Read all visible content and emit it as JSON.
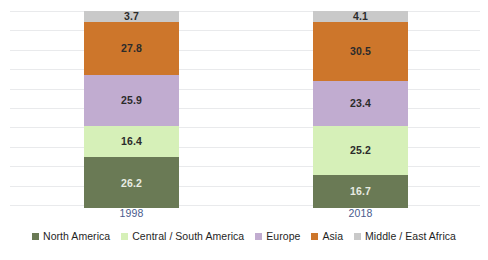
{
  "chart_data": {
    "type": "bar",
    "subtype": "stacked-100-percent",
    "title": "",
    "subtitle": "",
    "xlabel": "",
    "ylabel": "",
    "ylim": [
      0,
      100
    ],
    "grid": true,
    "legend_position": "bottom",
    "categories": [
      "1998",
      "2018"
    ],
    "series": [
      {
        "name": "North America",
        "color": "#6a7a55",
        "values": [
          26.2,
          16.7
        ]
      },
      {
        "name": "Central / South America",
        "color": "#d6f0b8",
        "values": [
          16.4,
          25.2
        ]
      },
      {
        "name": "Europe",
        "color": "#c1acd0",
        "values": [
          25.9,
          23.4
        ]
      },
      {
        "name": "Asia",
        "color": "#cd762b",
        "values": [
          27.8,
          30.5
        ]
      },
      {
        "name": "Middle / East Africa",
        "color": "#c9c9c9",
        "values": [
          3.7,
          4.1
        ]
      }
    ],
    "stack_order_bottom_to_top": [
      "North America",
      "Central / South America",
      "Europe",
      "Asia",
      "Middle / East Africa"
    ]
  },
  "axis": {
    "category_labels": [
      "1998",
      "2018"
    ],
    "category_label_color": "#4a5b8c",
    "gridline_color": "#e9eaec",
    "gridline_count": 11
  },
  "bars": {
    "bar_1998": {
      "category": "1998",
      "segments": [
        {
          "name": "Middle / East Africa",
          "value": "3.7",
          "color": "#c9c9c9",
          "label_style": "dark"
        },
        {
          "name": "Asia",
          "value": "27.8",
          "color": "#cd762b",
          "label_style": "dark"
        },
        {
          "name": "Europe",
          "value": "25.9",
          "color": "#c1acd0",
          "label_style": "dark"
        },
        {
          "name": "Central / South America",
          "value": "16.4",
          "color": "#d6f0b8",
          "label_style": "dark"
        },
        {
          "name": "North America",
          "value": "26.2",
          "color": "#6a7a55",
          "label_style": "light"
        }
      ]
    },
    "bar_2018": {
      "category": "2018",
      "segments": [
        {
          "name": "Middle / East Africa",
          "value": "4.1",
          "color": "#c9c9c9",
          "label_style": "dark"
        },
        {
          "name": "Asia",
          "value": "30.5",
          "color": "#cd762b",
          "label_style": "dark"
        },
        {
          "name": "Europe",
          "value": "23.4",
          "color": "#c1acd0",
          "label_style": "dark"
        },
        {
          "name": "Central / South America",
          "value": "25.2",
          "color": "#d6f0b8",
          "label_style": "dark"
        },
        {
          "name": "North America",
          "value": "16.7",
          "color": "#6a7a55",
          "label_style": "light"
        }
      ]
    }
  },
  "legend": {
    "items": [
      {
        "label": "North America",
        "color": "#6a7a55"
      },
      {
        "label": "Central / South America",
        "color": "#d6f0b8"
      },
      {
        "label": "Europe",
        "color": "#c1acd0"
      },
      {
        "label": "Asia",
        "color": "#cd762b"
      },
      {
        "label": "Middle / East Africa",
        "color": "#c9c9c9"
      }
    ]
  },
  "colors": {
    "background": "#ffffff",
    "north_america": "#6a7a55",
    "central_south_america": "#d6f0b8",
    "europe": "#c1acd0",
    "asia": "#cd762b",
    "middle_east_africa": "#c9c9c9",
    "gridline": "#e9eaec",
    "category_label": "#4a5b8c"
  }
}
